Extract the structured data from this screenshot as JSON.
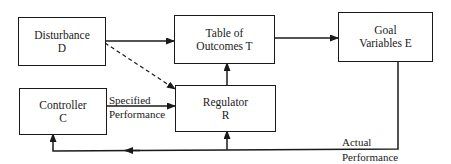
{
  "diagram": {
    "type": "control-system block diagram",
    "nodes": [
      {
        "id": "D",
        "line1": "Disturbance",
        "line2": "D"
      },
      {
        "id": "T",
        "line1": "Table of",
        "line2": "Outcomes T"
      },
      {
        "id": "E",
        "line1": "Goal",
        "line2": "Variables E"
      },
      {
        "id": "C",
        "line1": "Controller",
        "line2": "C"
      },
      {
        "id": "R",
        "line1": "Regulator",
        "line2": "R"
      }
    ],
    "edges": [
      {
        "from": "D",
        "to": "T",
        "style": "solid"
      },
      {
        "from": "D",
        "to": "R",
        "style": "dashed"
      },
      {
        "from": "T",
        "to": "E",
        "style": "solid"
      },
      {
        "from": "R",
        "to": "T",
        "style": "solid"
      },
      {
        "from": "C",
        "to": "R",
        "style": "solid",
        "label": "Specified Performance"
      },
      {
        "from": "E",
        "to": "C",
        "style": "solid",
        "label": "Actual Performance"
      },
      {
        "from": "E",
        "to": "R",
        "style": "solid"
      }
    ],
    "labels": {
      "specified_1": "Specified",
      "specified_2": "Performance",
      "actual_1": "Actual",
      "actual_2": "Performance"
    }
  }
}
